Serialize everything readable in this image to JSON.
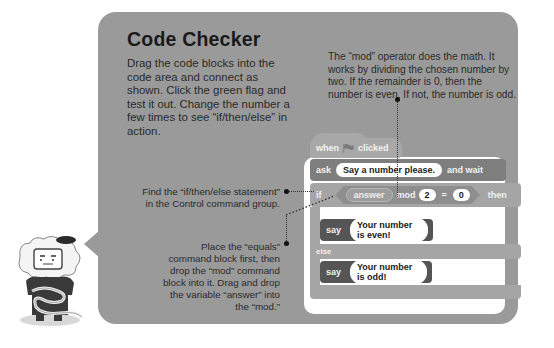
{
  "panel": {
    "title": "Code Checker",
    "intro": "Drag the code blocks into the code area and connect as shown. Click the green flag and test it out. Change the number a few times to see “if/then/else” in action.",
    "colors": {
      "panel": "#9a9a9a",
      "code_area": "#ffffff"
    }
  },
  "annotations": {
    "mod_note": "The “mod” operator does the math. It works by dividing the chosen number by two. If the remainder is 0, then the number is even. If not, the number is odd.",
    "if_note": "Find the “if/then/else statement” in the Control command group.",
    "equals_note": "Place the “equals” command block first, then drop the “mod” command block into it. Drag and drop the variable “answer” into the “mod.”"
  },
  "code": {
    "hat": {
      "when": "when",
      "flag_icon": "green-flag-icon",
      "clicked": "clicked"
    },
    "ask": {
      "keyword": "ask",
      "prompt": "Say a number please.",
      "suffix": "and wait"
    },
    "if": {
      "keyword": "if",
      "variable": "answer",
      "operator": "mod",
      "divisor": "2",
      "equals": "=",
      "target": "0",
      "then": "then"
    },
    "say_even": {
      "keyword": "say",
      "message": "Your number is even!"
    },
    "else": "else",
    "say_odd": {
      "keyword": "say",
      "message": "Your number is odd!"
    }
  }
}
